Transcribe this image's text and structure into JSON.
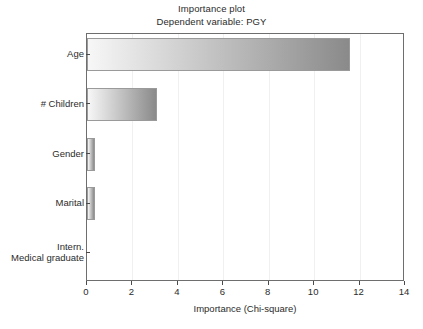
{
  "chart_data": {
    "type": "bar",
    "orientation": "horizontal",
    "title": "Importance plot",
    "subtitle": "Dependent variable: PGY",
    "xlabel": "Importance (Chi-square)",
    "ylabel": "",
    "xlim": [
      0,
      14
    ],
    "xticks": [
      0,
      2,
      4,
      6,
      8,
      10,
      12,
      14
    ],
    "xticklabels": [
      "0",
      "2",
      "4",
      "6",
      "8",
      "10",
      "12",
      "14"
    ],
    "grid": true,
    "legend": "none",
    "categories": [
      "Age",
      "# Children",
      "Gender",
      "Marital",
      "Intern.\nMedical graduate"
    ],
    "values": [
      11.6,
      3.1,
      0.35,
      0.35,
      0.02
    ],
    "bar_style": {
      "gradient_start": "#f7f7f7",
      "gradient_end": "#8a8a8a",
      "edge_color": "#9a9a9a"
    }
  },
  "axes": {
    "frame_color": "#6e6e6e",
    "gridline_color": "#f0f0f0",
    "tick_color": "#4a4a4a",
    "background": "#ffffff"
  }
}
